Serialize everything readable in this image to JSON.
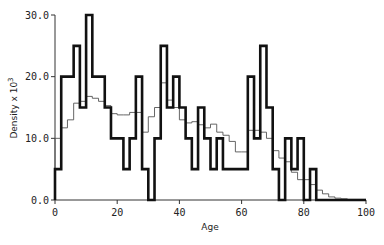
{
  "chart_data": {
    "type": "bar",
    "subtype": "step-histogram",
    "title": "",
    "xlabel": "Age",
    "ylabel": "Density x 10³",
    "xlim": [
      0,
      100
    ],
    "ylim": [
      0,
      30
    ],
    "grid": false,
    "legend": null,
    "x_ticks": [
      "0",
      "20",
      "40",
      "60",
      "80",
      "100"
    ],
    "y_ticks": [
      "0.0",
      "10.0",
      "20.0",
      "30.0"
    ],
    "bin_width": 2,
    "bin_edges_start": 0,
    "series": [
      {
        "name": "observed",
        "style": "bold",
        "values": [
          5,
          20,
          20,
          25,
          15,
          30,
          20,
          20,
          15,
          10,
          10,
          5,
          10,
          20,
          5,
          0,
          10,
          25,
          15,
          20,
          15,
          10,
          5,
          15,
          10,
          5,
          10,
          5,
          5,
          5,
          5,
          20,
          10,
          25,
          15,
          5,
          0,
          10,
          5,
          10,
          0,
          5,
          0,
          0,
          0,
          0,
          0,
          0,
          0,
          0
        ]
      },
      {
        "name": "smoothed",
        "style": "thin",
        "values": [
          10,
          11.7,
          13,
          15.7,
          16,
          16.8,
          16.5,
          16,
          15.3,
          14,
          13.8,
          13.8,
          14.2,
          14.2,
          11,
          13.5,
          15,
          19,
          16.2,
          15,
          13,
          12.5,
          12.7,
          12.2,
          11.7,
          12.3,
          11,
          10.5,
          9.5,
          7.8,
          7.8,
          11.3,
          11.3,
          11,
          10,
          8,
          6.8,
          6.2,
          4.5,
          3.3,
          3.3,
          2.5,
          1.6,
          1,
          0.5,
          0.3,
          0.2,
          0.1,
          0.1,
          0.1
        ]
      }
    ]
  },
  "axes": {
    "xlabel": "Age",
    "ylabel_main": "Density x 10",
    "ylabel_sup": "3"
  }
}
